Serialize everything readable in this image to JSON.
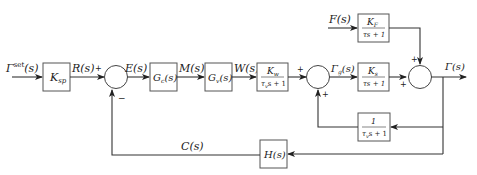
{
  "diagram": {
    "type": "block-diagram",
    "signals": {
      "setpoint": {
        "base": "Γ",
        "sup": "set",
        "arg": "(s)"
      },
      "reference": "R(s)",
      "error": "E(s)",
      "controller_output": "M(s)",
      "valve_output": "W(s)",
      "gamma_g": {
        "base": "Γ",
        "sub": "g",
        "arg": "(s)"
      },
      "disturbance": "F(s)",
      "output": "Γ(s)",
      "measurement": "C(s)"
    },
    "blocks": {
      "ksp": {
        "base": "K",
        "sub": "sp"
      },
      "gc": {
        "base": "G",
        "sub": "c",
        "arg": "(s)"
      },
      "gv": {
        "base": "G",
        "sub": "v",
        "arg": "(s)"
      },
      "kw": {
        "num_base": "K",
        "num_sub": "w",
        "den_pre": "τ",
        "den_sub": "v",
        "den_post": "s + 1"
      },
      "ks": {
        "num_base": "K",
        "num_sub": "s",
        "den": "τs + 1"
      },
      "kf": {
        "num_base": "K",
        "num_sub": "F",
        "den": "τs + 1"
      },
      "lag": {
        "num": "1",
        "den_pre": "τ",
        "den_sub": "v",
        "den_post": "s + 1"
      },
      "h": {
        "base": "H",
        "arg": "(s)"
      }
    },
    "signs": {
      "sum1_top": "+",
      "sum1_bottom": "−",
      "sum2_left": "+",
      "sum2_bottom": "+",
      "sum3_top": "+",
      "sum3_left": "+"
    }
  }
}
